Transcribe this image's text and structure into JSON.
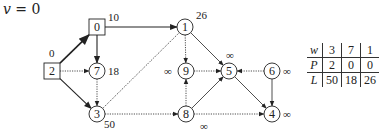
{
  "title": {
    "var": "v",
    "eq": " = 0"
  },
  "nodes": [
    {
      "id": "0",
      "label": "0",
      "shape": "square",
      "x": 97,
      "y": 27,
      "dist": "10",
      "dx": 11,
      "dy": -6
    },
    {
      "id": "2",
      "label": "2",
      "shape": "square",
      "x": 52,
      "y": 71,
      "dist": "0",
      "dx": -3,
      "dy": -14
    },
    {
      "id": "1",
      "label": "1",
      "shape": "circle",
      "x": 185,
      "y": 27,
      "dist": "26",
      "dx": 11,
      "dy": -8
    },
    {
      "id": "7",
      "label": "7",
      "shape": "circle",
      "x": 97,
      "y": 71,
      "dist": "18",
      "dx": 11,
      "dy": 4
    },
    {
      "id": "9",
      "label": "9",
      "shape": "circle",
      "x": 186,
      "y": 71,
      "dist": "∞",
      "dx": -22,
      "dy": 4
    },
    {
      "id": "5",
      "label": "5",
      "shape": "circle",
      "x": 229,
      "y": 71,
      "dist": "∞",
      "dx": -3,
      "dy": -12
    },
    {
      "id": "6",
      "label": "6",
      "shape": "circle",
      "x": 272,
      "y": 71,
      "dist": "∞",
      "dx": 11,
      "dy": 4
    },
    {
      "id": "3",
      "label": "3",
      "shape": "circle",
      "x": 97,
      "y": 114,
      "dist": "50",
      "dx": 7,
      "dy": 14
    },
    {
      "id": "8",
      "label": "8",
      "shape": "circle",
      "x": 186,
      "y": 114,
      "dist": "∞",
      "dx": 14,
      "dy": 16
    },
    {
      "id": "4",
      "label": "4",
      "shape": "circle",
      "x": 272,
      "y": 114,
      "dist": "∞",
      "dx": 11,
      "dy": 4
    }
  ],
  "edges": [
    {
      "from": "2",
      "to": "0",
      "style": "bold"
    },
    {
      "from": "0",
      "to": "1",
      "style": "solid"
    },
    {
      "from": "0",
      "to": "7",
      "style": "solid"
    },
    {
      "from": "2",
      "to": "7",
      "style": "dotted"
    },
    {
      "from": "2",
      "to": "3",
      "style": "solid"
    },
    {
      "from": "7",
      "to": "3",
      "style": "dotted"
    },
    {
      "from": "1",
      "to": "3",
      "style": "dotted-line"
    },
    {
      "from": "1",
      "to": "9",
      "style": "dotted"
    },
    {
      "from": "1",
      "to": "5",
      "style": "thin"
    },
    {
      "from": "9",
      "to": "5",
      "style": "dotted"
    },
    {
      "from": "8",
      "to": "9",
      "style": "dotted"
    },
    {
      "from": "8",
      "to": "5",
      "style": "thin"
    },
    {
      "from": "3",
      "to": "8",
      "style": "dotted"
    },
    {
      "from": "6",
      "to": "5",
      "style": "dotted"
    },
    {
      "from": "6",
      "to": "4",
      "style": "thin"
    },
    {
      "from": "5",
      "to": "4",
      "style": "thin"
    },
    {
      "from": "8",
      "to": "4",
      "style": "dotted"
    }
  ],
  "table": {
    "rows": [
      {
        "header": "w",
        "cells": [
          "3",
          "7",
          "1"
        ]
      },
      {
        "header": "P",
        "cells": [
          "2",
          "0",
          "0"
        ]
      },
      {
        "header": "L",
        "cells": [
          "50",
          "18",
          "26"
        ]
      }
    ]
  }
}
